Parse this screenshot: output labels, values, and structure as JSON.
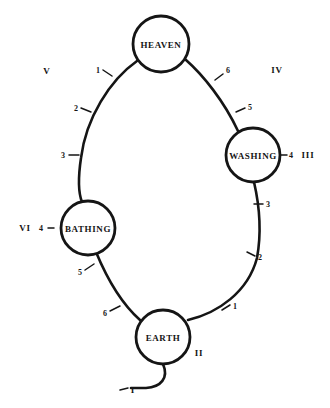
{
  "diagram": {
    "type": "cycle-diagram",
    "stroke_color": "#151515",
    "background_color": "#ffffff",
    "canvas": {
      "width": 330,
      "height": 408
    }
  },
  "nodes": [
    {
      "id": "heaven",
      "label": "HEAVEN",
      "cx": 161,
      "cy": 44,
      "r": 28
    },
    {
      "id": "washing",
      "label": "WASHING",
      "cx": 253,
      "cy": 155,
      "r": 27
    },
    {
      "id": "bathing",
      "label": "BATHING",
      "cx": 88,
      "cy": 228,
      "r": 27
    },
    {
      "id": "earth",
      "label": "EARTH",
      "cx": 163,
      "cy": 337,
      "r": 27
    }
  ],
  "arc_ticks": [
    {
      "id": "tick-v-1",
      "label": "1",
      "x": 98,
      "y": 70,
      "arc": "heaven-bathing"
    },
    {
      "id": "tick-v-2",
      "label": "2",
      "x": 76,
      "y": 108,
      "arc": "heaven-bathing"
    },
    {
      "id": "tick-v-3",
      "label": "3",
      "x": 63,
      "y": 155,
      "arc": "heaven-bathing"
    },
    {
      "id": "tick-iv-6",
      "label": "6",
      "x": 228,
      "y": 70,
      "arc": "heaven-washing"
    },
    {
      "id": "tick-iv-5",
      "label": "5",
      "x": 250,
      "y": 107,
      "arc": "heaven-washing"
    },
    {
      "id": "tick-iii-3",
      "label": "3",
      "x": 268,
      "y": 204,
      "arc": "washing-earth"
    },
    {
      "id": "tick-ii-2",
      "label": "2",
      "x": 260,
      "y": 257,
      "arc": "washing-earth"
    },
    {
      "id": "tick-ii-1",
      "label": "1",
      "x": 235,
      "y": 306,
      "arc": "washing-earth"
    },
    {
      "id": "tick-vi-5",
      "label": "5",
      "x": 80,
      "y": 272,
      "arc": "bathing-earth"
    },
    {
      "id": "tick-vi-6",
      "label": "6",
      "x": 105,
      "y": 313,
      "arc": "bathing-earth"
    }
  ],
  "node_ticks": [
    {
      "id": "washing-tick-4",
      "label": "4",
      "x": 291,
      "y": 155
    },
    {
      "id": "bathing-tick-4",
      "label": "4",
      "x": 41,
      "y": 228
    }
  ],
  "roman_labels": [
    {
      "id": "roman-v",
      "label": "V",
      "x": 47,
      "y": 71
    },
    {
      "id": "roman-iv",
      "label": "IV",
      "x": 277,
      "y": 70
    },
    {
      "id": "roman-iii",
      "label": "III",
      "x": 308,
      "y": 155
    },
    {
      "id": "roman-vi",
      "label": "VI",
      "x": 25,
      "y": 228
    },
    {
      "id": "roman-ii",
      "label": "II",
      "x": 199,
      "y": 353
    },
    {
      "id": "roman-i",
      "label": "I",
      "x": 133,
      "y": 390
    }
  ]
}
